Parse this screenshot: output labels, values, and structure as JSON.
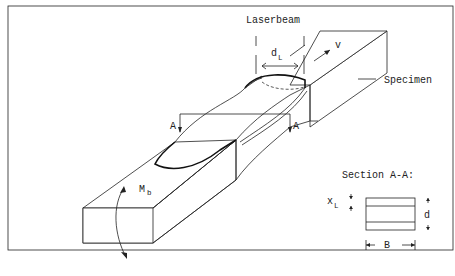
{
  "diagram": {
    "labels": {
      "laserbeam": "Laserbeam",
      "d_L_main": "d",
      "d_L_sub": "L",
      "velocity": "v",
      "specimen": "Specimen",
      "section_left": "A",
      "section_right": "A",
      "moment_main": "M",
      "moment_sub": "b"
    },
    "section_detail": {
      "title": "Section A-A:",
      "x_L_main": "x",
      "x_L_sub": "L",
      "thickness": "d",
      "width": "B"
    },
    "colors": {
      "line": "#222222",
      "background": "#ffffff"
    }
  }
}
